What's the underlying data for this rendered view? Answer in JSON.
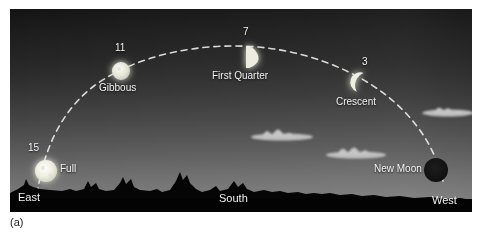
{
  "figure": {
    "caption": "(a)"
  },
  "photo": {
    "sky_top_color": "#141414",
    "sky_horizon_color": "#828282",
    "ground_color": "#050505"
  },
  "directions": [
    {
      "name": "east-label",
      "label": "East",
      "x": 8,
      "y": 182
    },
    {
      "name": "south-label",
      "label": "South",
      "x": 207,
      "y": 182
    },
    {
      "name": "west-label",
      "label": "West",
      "x": 418,
      "y": 182
    }
  ],
  "moons": [
    {
      "id": "full",
      "day": "15",
      "phase_label": "Full",
      "cx": 36,
      "cy": 162,
      "r": 11,
      "fill": "#f0f0e8",
      "num_x": 18,
      "num_y": 140,
      "name_x": 51,
      "name_y": 159
    },
    {
      "id": "gibbous",
      "day": "11",
      "phase_label": "Gibbous",
      "cx": 111,
      "cy": 62,
      "r": 9,
      "fill": "#e8e8e0",
      "num_x": 104,
      "num_y": 41,
      "name_x": 90,
      "name_y": 78
    },
    {
      "id": "first-quarter",
      "day": "7",
      "phase_label": "First Quarter",
      "cx": 235,
      "cy": 48,
      "r": 11,
      "fill": "#e4e4dc",
      "num_x": 231,
      "num_y": 24,
      "name_x": 203,
      "name_y": 65
    },
    {
      "id": "crescent",
      "day": "3",
      "phase_label": "Crescent",
      "cx": 355,
      "cy": 74,
      "r": 10,
      "fill": "#e8e8e0",
      "num_x": 351,
      "num_y": 53,
      "name_x": 327,
      "name_y": 92
    },
    {
      "id": "new-moon",
      "day": "",
      "phase_label": "New Moon",
      "cx": 426,
      "cy": 161,
      "r": 12,
      "fill": "#151515",
      "num_x": 0,
      "num_y": 0,
      "name_x": 372,
      "name_y": 158
    }
  ],
  "path": {
    "name": "ecliptic-dashed-arc",
    "stroke": "#e6e6e6",
    "dash": "6 5"
  },
  "clouds": [
    {
      "name": "cloud-upper-right",
      "x": 436,
      "y": 100
    },
    {
      "name": "cloud-mid-left",
      "x": 270,
      "y": 124
    },
    {
      "name": "cloud-mid-right",
      "x": 342,
      "y": 140
    }
  ]
}
